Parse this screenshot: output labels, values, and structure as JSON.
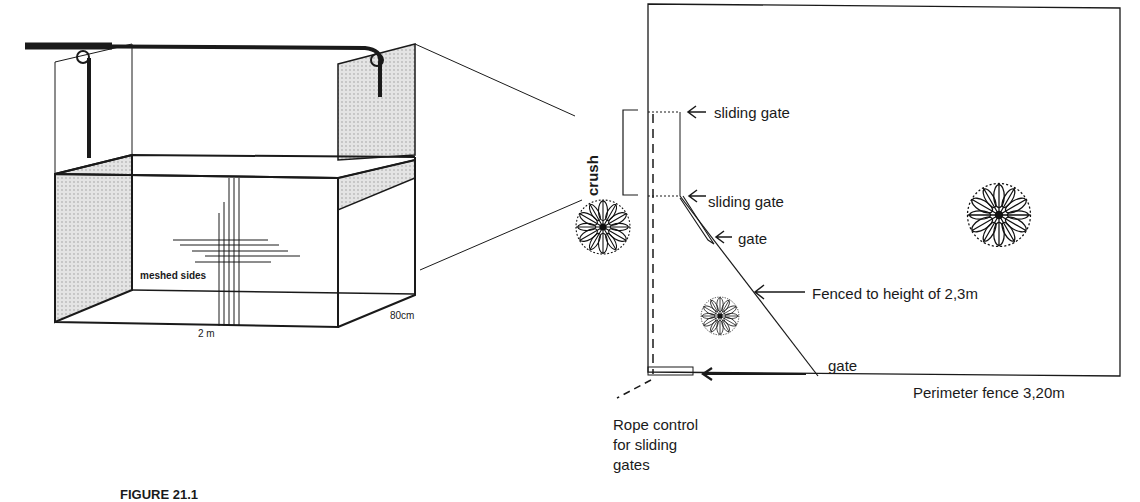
{
  "crush_3d": {
    "label_meshed": "meshed sides",
    "label_length": "2 m",
    "label_width": "80cm"
  },
  "plan": {
    "crush_label": "crush",
    "sliding_gate_top": "sliding gate",
    "sliding_gate_bottom": "sliding gate",
    "gate_diagonal": "gate",
    "fence_label": "Fenced to height of 2,3m",
    "gate_bottom": "gate",
    "perimeter_label": "Perimeter fence 3,20m",
    "rope_label_1": "Rope control",
    "rope_label_2": "for sliding",
    "rope_label_3": "gates"
  },
  "caption": {
    "text": "FIGURE 21.1"
  },
  "colors": {
    "line": "#1a1a1a",
    "mesh": "#d8d8d8",
    "background": "#ffffff"
  },
  "icons": [
    "tree-icon",
    "tree-icon",
    "tree-icon",
    "arrow-left-icon"
  ]
}
